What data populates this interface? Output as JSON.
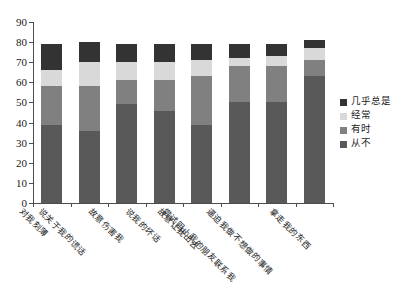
{
  "chart_data": {
    "type": "bar",
    "stacked": true,
    "title": "",
    "xlabel": "",
    "ylabel": "",
    "ylim": [
      0,
      90
    ],
    "ytick_step": 10,
    "yticks": [
      0,
      10,
      20,
      30,
      40,
      50,
      60,
      70,
      80,
      90
    ],
    "grid": false,
    "legend_position": "right",
    "categories": [
      "对我刻薄",
      "说关于我的谎话",
      "故意伤害我",
      "说我的坏话",
      "故意让我出去",
      "尝试阻止我的朋友联系我",
      "逼迫我做不想做的事情",
      "拿走我的东西"
    ],
    "series": [
      {
        "name": "从不",
        "color": "#595959",
        "values": [
          39,
          36,
          49,
          46,
          39,
          50,
          50,
          63
        ]
      },
      {
        "name": "有时",
        "color": "#808080",
        "values": [
          19,
          22,
          12,
          15,
          24,
          18,
          18,
          8
        ]
      },
      {
        "name": "经常",
        "color": "#d9d9d9",
        "values": [
          8,
          12,
          9,
          9,
          8,
          4,
          5,
          6
        ]
      },
      {
        "name": "几乎总是",
        "color": "#333333",
        "values": [
          13,
          10,
          9,
          9,
          8,
          7,
          6,
          4
        ]
      }
    ],
    "legend_order": [
      "几乎总是",
      "经常",
      "有时",
      "从不"
    ],
    "totals": [
      79,
      80,
      79,
      79,
      79,
      79,
      79,
      81
    ]
  },
  "colors": {
    "axis": "#4d4d4d",
    "text": "#1a1a1a",
    "background": "#ffffff"
  }
}
